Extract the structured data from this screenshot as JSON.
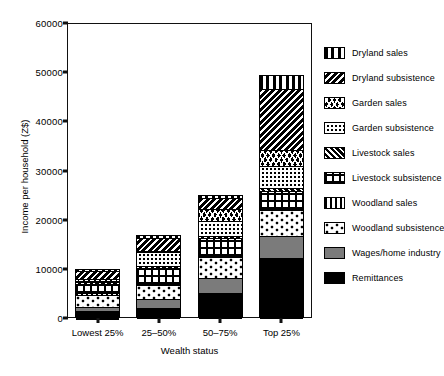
{
  "chart_data": {
    "type": "bar",
    "subtype": "stacked-bar",
    "title": "",
    "xlabel": "Wealth status",
    "ylabel": "Income per household (Z$)",
    "categories": [
      "Lowest 25%",
      "25–50%",
      "50–75%",
      "Top 25%"
    ],
    "ylim": [
      0,
      60000
    ],
    "yticks": [
      0,
      10000,
      20000,
      30000,
      40000,
      50000,
      60000
    ],
    "ytick_labels": [
      "0",
      "10000",
      "20000",
      "30000",
      "40000",
      "50000",
      "60000"
    ],
    "grid": false,
    "legend_position": "right",
    "stack_order_bottom_to_top": [
      "Remittances",
      "Wages/home industry",
      "Woodland subsistence",
      "Woodland sales",
      "Livestock subsistence",
      "Livestock sales",
      "Garden subsistence",
      "Garden sales",
      "Dryland subsistence",
      "Dryland sales"
    ],
    "series": [
      {
        "name": "Remittances",
        "pattern": "solid-black",
        "values": [
          1700,
          2400,
          5300,
          12300
        ]
      },
      {
        "name": "Wages/home industry",
        "pattern": "solid-gray",
        "values": [
          800,
          1700,
          3000,
          4600
        ]
      },
      {
        "name": "Woodland subsistence",
        "pattern": "wavy-zigzag",
        "values": [
          2600,
          2900,
          4300,
          5200
        ]
      },
      {
        "name": "Woodland sales",
        "pattern": "vertical-bars",
        "values": [
          200,
          200,
          300,
          300
        ]
      },
      {
        "name": "Livestock subsistence",
        "pattern": "grid-cross",
        "values": [
          2000,
          3200,
          3500,
          3700
        ]
      },
      {
        "name": "Livestock sales",
        "pattern": "diagonal-dense",
        "values": [
          300,
          400,
          400,
          500
        ]
      },
      {
        "name": "Garden subsistence",
        "pattern": "dotted-checker",
        "values": [
          300,
          2800,
          3200,
          4500
        ]
      },
      {
        "name": "Garden sales",
        "pattern": "zigzag-diamond",
        "values": [
          200,
          300,
          2400,
          3200
        ]
      },
      {
        "name": "Dryland subsistence",
        "pattern": "diagonal-stripes",
        "values": [
          1700,
          2700,
          2300,
          12400
        ]
      },
      {
        "name": "Dryland sales",
        "pattern": "vertical-thick",
        "values": [
          200,
          200,
          300,
          2800
        ]
      }
    ],
    "totals": [
      10000,
      16800,
      25000,
      49500
    ]
  },
  "legend": {
    "items": [
      {
        "label": "Dryland sales"
      },
      {
        "label": "Dryland subsistence"
      },
      {
        "label": "Garden sales"
      },
      {
        "label": "Garden subsistence"
      },
      {
        "label": "Livestock sales"
      },
      {
        "label": "Livestock subsistence"
      },
      {
        "label": "Woodland sales"
      },
      {
        "label": "Woodland subsistence"
      },
      {
        "label": "Wages/home industry"
      },
      {
        "label": "Remittances"
      }
    ]
  },
  "colors": {
    "axis": "#111111",
    "black_fill": "#000000",
    "gray_fill": "#7b7b7b",
    "background": "#ffffff"
  }
}
